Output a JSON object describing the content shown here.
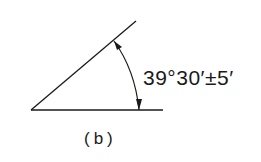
{
  "diagram": {
    "angle_label": "39°30′±5′",
    "caption": "(b)",
    "colors": {
      "line": "#1a1a1a",
      "background": "#ffffff"
    },
    "geometry": {
      "vertex": [
        31,
        110
      ],
      "horizontal_end": [
        163,
        110
      ],
      "slanted_end": [
        136,
        21
      ],
      "arc_start": [
        114,
        41
      ],
      "arc_end": [
        139,
        110
      ]
    }
  }
}
